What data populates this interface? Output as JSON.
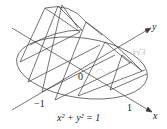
{
  "figure": {
    "labels": {
      "y_axis": "y",
      "x_axis": "x",
      "origin": "0",
      "neg_one": "−1",
      "pos_one": "1",
      "equation": "x² + y² = 1",
      "annotation": "x√3"
    },
    "colors": {
      "line": "#3a3a3a",
      "background": "#ffffff",
      "annotation": "#b8b8b8"
    }
  }
}
